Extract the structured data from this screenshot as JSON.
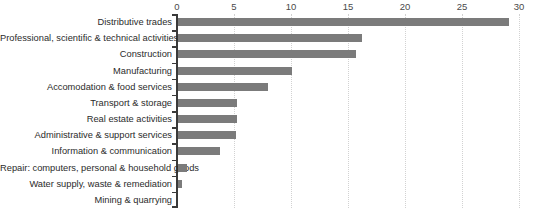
{
  "chart_data": {
    "type": "bar",
    "orientation": "horizontal",
    "title": "",
    "subtitle": "",
    "xlabel": "",
    "ylabel": "",
    "xlim": [
      0,
      30
    ],
    "xticks": [
      0,
      5,
      10,
      15,
      20,
      25,
      30
    ],
    "xtick_labels": [
      "0",
      "5",
      "10",
      "15",
      "20",
      "25",
      "30"
    ],
    "grid": true,
    "grid_axis": "x",
    "grid_style": "dotted",
    "legend": false,
    "bar_color": "#7b7b7b",
    "axis_color": "#3a3a3a",
    "gridline_color": "#d2d2d2",
    "categories": [
      "Distributive trades",
      "Professional, scientific & technical activities",
      "Construction",
      "Manufacturing",
      "Accomodation & food services",
      "Transport & storage",
      "Real estate activities",
      "Administrative & support services",
      "Information & communication",
      "Repair: computers, personal & household goods",
      "Water supply, waste & remediation",
      "Mining & quarrying"
    ],
    "values": [
      29.0,
      16.1,
      15.6,
      10.0,
      7.9,
      5.2,
      5.2,
      5.1,
      3.7,
      0.8,
      0.35,
      0.0
    ]
  }
}
